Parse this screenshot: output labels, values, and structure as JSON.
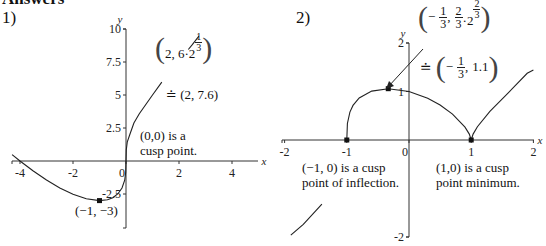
{
  "heading": "Answers",
  "chart_data": [
    {
      "type": "line",
      "label": "1)",
      "function": "y = x^(1/3)(x+4)",
      "xlabel": "x",
      "ylabel": "y",
      "xlim": [
        -4.3,
        5.0
      ],
      "ylim": [
        -5,
        10
      ],
      "xticks": [
        -4,
        -2,
        0,
        2,
        4
      ],
      "xtick_labels": [
        "-4",
        "-2",
        "0",
        "2",
        "4"
      ],
      "yticks": [
        -2.5,
        2.5,
        5,
        7.5,
        10
      ],
      "ytick_labels": [
        "-2.5",
        "2.5",
        "5",
        "7.5",
        "10"
      ],
      "grid": false,
      "series": [
        {
          "name": "curve-lower",
          "x": [
            -4.3,
            -4,
            -3.5,
            -3,
            -2.5,
            -2,
            -1.5,
            -1,
            -0.7,
            -0.5,
            -0.3,
            -0.15,
            -0.05,
            -0.01,
            0,
            0.01,
            0.05,
            0.15,
            0.3,
            0.5,
            1,
            1.35
          ],
          "y": [
            0.488,
            0,
            -0.759,
            -1.442,
            -2.036,
            -2.52,
            -2.862,
            -3,
            -2.931,
            -2.778,
            -2.476,
            -2.045,
            -1.455,
            -0.859,
            0,
            0.859,
            1.455,
            2.045,
            2.877,
            3.572,
            5,
            5.98
          ]
        },
        {
          "name": "curve-upper",
          "x": [
            2.35,
            2.5,
            2.75
          ],
          "y": [
            8.45,
            8.82,
            9.46
          ]
        }
      ],
      "points": [
        {
          "x": -1,
          "y": -3,
          "label": "(−1, −3)"
        }
      ],
      "annotations": [
        {
          "text": "(0,0) is a",
          "text2": "cusp point."
        },
        {
          "text": "(2, 6·2^(1/3)) ≐ (2, 7.6)"
        }
      ],
      "annotation_parts": {
        "open": "(",
        "close": ")",
        "coord": "2, 6·2",
        "exp_num": "1",
        "exp_den": "3",
        "approx": "≐ (2, 7.6)"
      }
    },
    {
      "type": "line",
      "label": "2)",
      "function": "y = (x+1)^(1/3)(x−1)^(2/3)",
      "xlabel": "x",
      "ylabel": "y",
      "xlim": [
        -2,
        2
      ],
      "ylim": [
        -2,
        2
      ],
      "xticks": [
        -2,
        -1,
        0,
        1,
        2
      ],
      "xtick_labels": [
        "-2",
        "-1",
        "0",
        "1",
        "2"
      ],
      "yticks": [
        -2,
        1,
        2
      ],
      "ytick_labels": [
        "-2",
        "1",
        "2"
      ],
      "grid": false,
      "series": [
        {
          "name": "curve-left",
          "x": [
            -1.9,
            -1.7,
            -1.5,
            -1.4
          ],
          "y": [
            -1.963,
            -1.74,
            -1.462,
            -1.321
          ]
        },
        {
          "name": "curve-main",
          "x": [
            -1,
            -0.99,
            -0.95,
            -0.9,
            -0.8,
            -0.6,
            -0.3333,
            0,
            0.3,
            0.5,
            0.7,
            0.9,
            0.97,
            1,
            1.03,
            1.1,
            1.3,
            1.6,
            1.9,
            2
          ],
          "y": [
            0,
            0.341,
            0.575,
            0.713,
            0.868,
            1.008,
            1.058,
            1,
            0.86,
            0.721,
            0.535,
            0.267,
            0.121,
            0,
            0.122,
            0.275,
            0.591,
            0.978,
            1.376,
            1.442
          ]
        }
      ],
      "points": [
        {
          "x": -1,
          "y": 0
        },
        {
          "x": -0.3333,
          "y": 1.058
        },
        {
          "x": 1,
          "y": 0
        }
      ],
      "annotations": [
        {
          "text": "(−1, 0) is a cusp",
          "text2": "point of inflection."
        },
        {
          "text": "(1,0) is a cusp",
          "text2": "point minimum."
        },
        {
          "text": "(−1/3, (2/3)·2^(2/3)) ≐ (−1/3, 1.1)"
        }
      ],
      "annotation_parts": {
        "neg": "−",
        "one": "1",
        "three": "3",
        "two": "2",
        "dot2": "·2",
        "comma": ",",
        "approx": "≐",
        "val": "1.1"
      }
    }
  ],
  "plot1_label": "1)",
  "plot2_label": "2)"
}
